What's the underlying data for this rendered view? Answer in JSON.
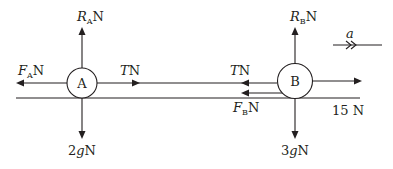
{
  "diagram": {
    "particle_a": {
      "label": "A",
      "forces": {
        "reaction": {
          "symbol": "R",
          "subscript": "A",
          "unit": "N"
        },
        "friction": {
          "symbol": "F",
          "subscript": "A",
          "unit": "N"
        },
        "tension": {
          "symbol": "T",
          "unit": "N"
        },
        "weight": {
          "text": "2gN",
          "coef": "2",
          "g": "g",
          "unit": "N"
        }
      }
    },
    "particle_b": {
      "label": "B",
      "forces": {
        "reaction": {
          "symbol": "R",
          "subscript": "B",
          "unit": "N"
        },
        "friction": {
          "symbol": "F",
          "subscript": "B",
          "unit": "N"
        },
        "tension": {
          "symbol": "T",
          "unit": "N"
        },
        "weight": {
          "coef": "3",
          "g": "g",
          "unit": "N"
        },
        "applied": {
          "text": "15 N",
          "value": "15",
          "unit": "N"
        }
      }
    },
    "acceleration": {
      "symbol": "a"
    },
    "colors": {
      "ink": "#231f20",
      "background": "#ffffff"
    }
  }
}
